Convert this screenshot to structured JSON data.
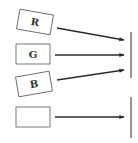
{
  "diagram": {
    "type": "channel-combination",
    "colors": {
      "stroke": "#2a2a2a",
      "box_stroke": "#555555",
      "background": "#ffffff"
    },
    "groups": [
      {
        "name": "rgb-group",
        "inputs": [
          {
            "label": "R",
            "rotation_deg": 10
          },
          {
            "label": "G",
            "rotation_deg": 0
          },
          {
            "label": "B",
            "rotation_deg": -10
          }
        ],
        "target": "vertical-bar-1"
      },
      {
        "name": "single-group",
        "inputs": [
          {
            "label": "",
            "rotation_deg": 0
          }
        ],
        "target": "vertical-bar-2"
      }
    ]
  }
}
